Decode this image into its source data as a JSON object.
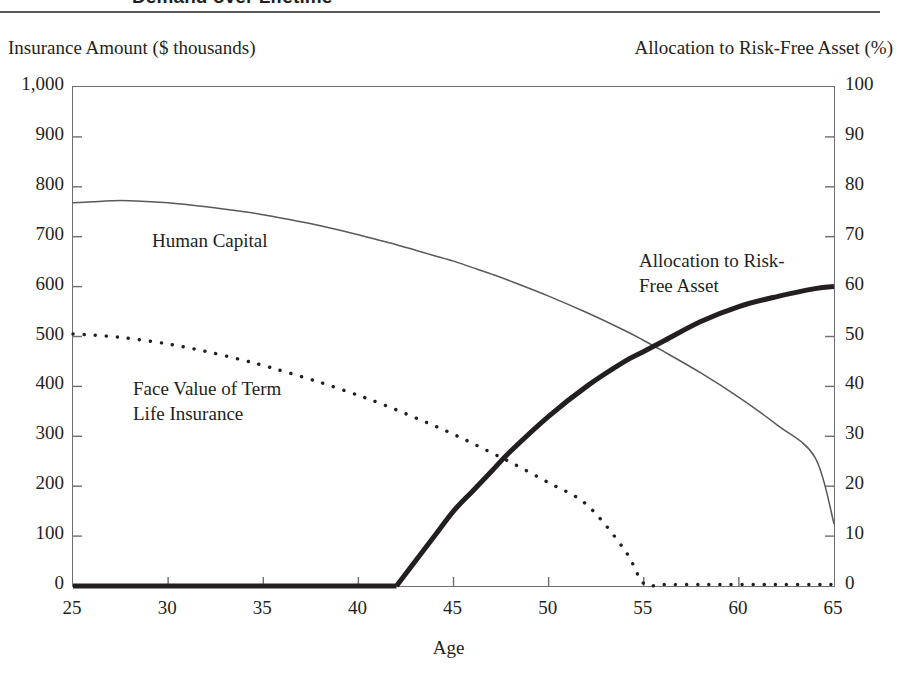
{
  "title": "Demand over Lifetime",
  "axes": {
    "left_caption": "Insurance Amount ($ thousands)",
    "right_caption": "Allocation to Risk-Free Asset (%)",
    "x_title": "Age",
    "left_ticks": [
      "1,000",
      "900",
      "800",
      "700",
      "600",
      "500",
      "400",
      "300",
      "200",
      "100",
      "0"
    ],
    "right_ticks": [
      "100",
      "90",
      "80",
      "70",
      "60",
      "50",
      "40",
      "30",
      "20",
      "10",
      "0"
    ],
    "x_ticks": [
      "25",
      "30",
      "35",
      "40",
      "45",
      "50",
      "55",
      "60",
      "65"
    ]
  },
  "annotations": {
    "human_capital": "Human Capital",
    "face_value_line1": "Face Value of Term",
    "face_value_line2": "Life Insurance",
    "allocation_line1": "Allocation to Risk-",
    "allocation_line2": "Free Asset"
  },
  "colors": {
    "ink": "#231f20",
    "frame": "#6d6e71",
    "rule": "#58595b"
  },
  "chart_data": {
    "type": "line",
    "title": "Demand over Lifetime",
    "xlabel": "Age",
    "ylabel": "Insurance Amount ($ thousands)",
    "y2label": "Allocation to Risk-Free Asset (%)",
    "xlim": [
      25,
      65
    ],
    "ylim": [
      0,
      1000
    ],
    "y2lim": [
      0,
      100
    ],
    "grid": false,
    "legend": "inline-annotations",
    "x": [
      25,
      26,
      27,
      28,
      30,
      32,
      34,
      35,
      36,
      38,
      40,
      41,
      42,
      43,
      44,
      45,
      46,
      47,
      48,
      50,
      52,
      54,
      55,
      56,
      58,
      60,
      62,
      64,
      65
    ],
    "series": [
      {
        "name": "Human Capital",
        "axis": "left",
        "style": "thin-solid",
        "units": "$ thousands",
        "values": [
          768,
          770,
          772,
          772,
          768,
          760,
          750,
          744,
          737,
          722,
          704,
          694,
          684,
          673,
          662,
          651,
          638,
          625,
          611,
          581,
          548,
          512,
          492,
          471,
          427,
          378,
          323,
          258,
          125
        ]
      },
      {
        "name": "Face Value of Term Life Insurance",
        "axis": "left",
        "style": "dotted",
        "units": "$ thousands",
        "values": [
          505,
          503,
          500,
          496,
          485,
          470,
          452,
          442,
          431,
          408,
          382,
          368,
          353,
          337,
          321,
          304,
          286,
          267,
          248,
          207,
          163,
          72,
          5,
          3,
          3,
          3,
          3,
          3,
          3
        ]
      },
      {
        "name": "Allocation to Risk-Free Asset",
        "axis": "right",
        "style": "thick-solid",
        "units": "%",
        "values": [
          0,
          0,
          0,
          0,
          0,
          0,
          0,
          0,
          0,
          0,
          0,
          0,
          0,
          5,
          10,
          15,
          19,
          23,
          27,
          34,
          40,
          45,
          47,
          49,
          53,
          56,
          58,
          59.6,
          60
        ]
      }
    ]
  }
}
